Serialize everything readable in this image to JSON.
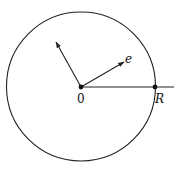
{
  "diagram": {
    "title": "",
    "circle": {
      "cx": 81,
      "cy": 86.5,
      "r": 74.5,
      "stroke": "#222222"
    },
    "origin": {
      "x": 81,
      "y": 87,
      "label": "0"
    },
    "point_R": {
      "x": 155,
      "y": 87,
      "label": "R"
    },
    "ray_end": {
      "x": 174,
      "y": 87
    },
    "vector_e": {
      "x": 124,
      "y": 62,
      "label": "e"
    },
    "vector_other": {
      "x": 56,
      "y": 42,
      "label": ""
    },
    "colors": {
      "line": "#222222",
      "background": "#ffffff"
    }
  }
}
